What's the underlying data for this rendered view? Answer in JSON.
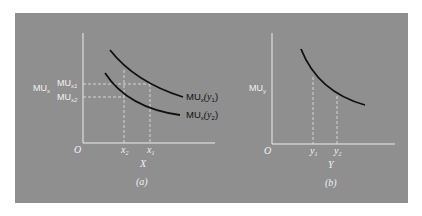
{
  "figure": {
    "panel_a": {
      "y_axis_label": "MU",
      "y_axis_label_sub": "x",
      "tick_mu1": "MU",
      "tick_mu1_sub": "x1",
      "tick_mu2": "MU",
      "tick_mu2_sub": "x2",
      "origin": "O",
      "x_tick_1": "x",
      "x_tick_1_sub": "2",
      "x_tick_2": "x",
      "x_tick_2_sub": "1",
      "x_axis_label": "X",
      "caption": "(a)",
      "curve_upper_label": "MU",
      "curve_upper_label_sub": "x",
      "curve_upper_arg": "(y",
      "curve_upper_arg_sub": "1",
      "curve_upper_close": ")",
      "curve_lower_label": "MU",
      "curve_lower_label_sub": "x",
      "curve_lower_arg": "(y",
      "curve_lower_arg_sub": "2",
      "curve_lower_close": ")"
    },
    "panel_b": {
      "y_axis_label": "MU",
      "y_axis_label_sub": "y",
      "origin": "O",
      "x_tick_1": "y",
      "x_tick_1_sub": "1",
      "x_tick_2": "y",
      "x_tick_2_sub": "2",
      "x_axis_label": "Y",
      "caption": "(b)"
    },
    "colors": {
      "background": "#8f8f8f",
      "axis": "#ececec",
      "curve": "#111111"
    }
  }
}
